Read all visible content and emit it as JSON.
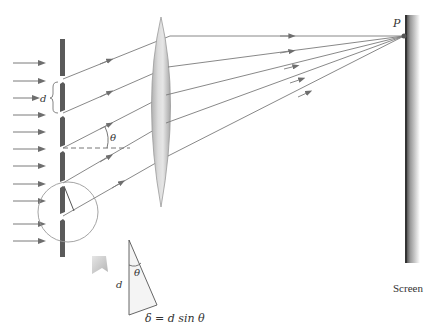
{
  "figure": {
    "type": "diffraction-grating-diagram",
    "labels": {
      "slit_spacing": "d",
      "angle": "θ",
      "point": "P",
      "screen": "Screen",
      "inset_side": "d",
      "inset_angle": "θ",
      "path_difference": "δ = d sin θ"
    }
  },
  "colors": {
    "grating": "#5a5a5a",
    "ray": "#7a7a7a",
    "arrow": "#6e6e6e",
    "lens_edge": "#9a9a9a",
    "lens_fill": "#c8c8c8",
    "screen": "#333333",
    "circle": "#9a9a9a"
  }
}
